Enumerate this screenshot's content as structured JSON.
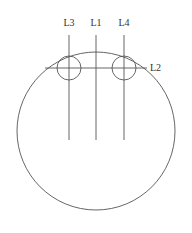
{
  "diagram": {
    "labels": {
      "l1": "L1",
      "l2": "L2",
      "l3": "L3",
      "l4": "L4"
    },
    "colors": {
      "stroke": "#555555",
      "text": "#333333",
      "background": "#ffffff"
    }
  }
}
